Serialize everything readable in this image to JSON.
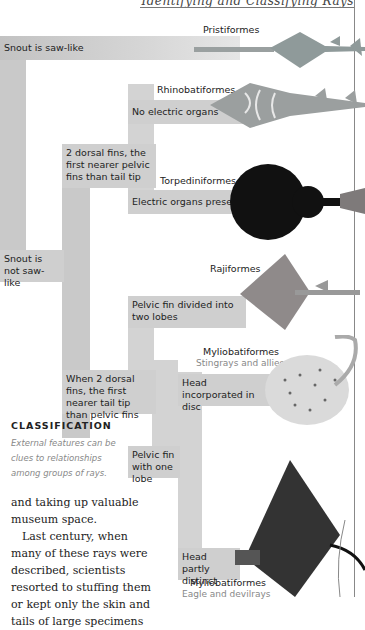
{
  "header": {
    "running_title": "Identifying and Classifying Rays"
  },
  "key": {
    "nodes": [
      {
        "id": "snout-saw",
        "label": "Snout is saw-like"
      },
      {
        "id": "snout-not-saw",
        "label": "Snout is not saw-like"
      },
      {
        "id": "dorsal-nearer-pelvic",
        "label": "2 dorsal fins, the first nearer pelvic fins than tail tip"
      },
      {
        "id": "no-electric",
        "label": "No electric organs"
      },
      {
        "id": "electric",
        "label": "Electric organs present"
      },
      {
        "id": "dorsal-nearer-tail",
        "label": "When 2 dorsal fins, the first nearer tail tip than pelvic fins"
      },
      {
        "id": "pelvic-two",
        "label": "Pelvic fin divided into two lobes"
      },
      {
        "id": "pelvic-one",
        "label": "Pelvic fin with one lobe"
      },
      {
        "id": "head-in-disc",
        "label": "Head incorporated in disc"
      },
      {
        "id": "head-distinct",
        "label": "Head partly distinct"
      }
    ],
    "taxa": [
      {
        "name": "Pristiformes",
        "common": ""
      },
      {
        "name": "Rhinobatiformes",
        "common": ""
      },
      {
        "name": "Torpediniformes",
        "common": ""
      },
      {
        "name": "Rajiformes",
        "common": ""
      },
      {
        "name": "Myliobatiformes",
        "common": "Stingrays and allies"
      },
      {
        "name": "Myliobatiformes",
        "common": "Eagle and devilrays"
      }
    ]
  },
  "sidebar": {
    "title": "CLASSIFICATION",
    "text": "External features can be clues to relationships among groups of rays."
  },
  "body": {
    "paragraphs": [
      "and taking up valuable museum space.",
      "Last century, when many of these rays were described, scientists resorted to stuffing them or kept only the skin and tails of large specimens"
    ]
  },
  "colors": {
    "bar": "#c9c9c9",
    "box": "#cfcfcf",
    "rule": "#888888",
    "caption": "#888888"
  }
}
